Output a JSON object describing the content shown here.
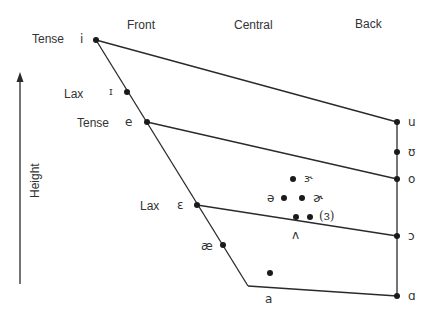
{
  "columns": {
    "front": "Front",
    "central": "Central",
    "back": "Back"
  },
  "axis": {
    "label": "Height"
  },
  "tense_lax": {
    "tense_i": "Tense",
    "lax_I": "Lax",
    "tense_e": "Tense",
    "lax_eps": "Lax"
  },
  "vowels": {
    "i": "i",
    "I": "ɪ",
    "e": "e",
    "eps": "ɛ",
    "ae": "æ",
    "a": "a",
    "u": "u",
    "U": "ʊ",
    "o": "o",
    "open_o": "ɔ",
    "alpha": "ɑ",
    "schwa": "ə",
    "schwar": "ɚ",
    "er": "ɝ",
    "wedge": "ʌ",
    "paren_er": "(ɜ)"
  },
  "colors": {
    "line": "#2a2a2a",
    "dot": "#1a1a1a",
    "text": "#333333"
  }
}
